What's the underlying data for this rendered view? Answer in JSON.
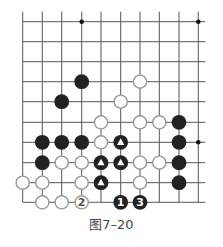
{
  "figure": {
    "caption": "图7–20",
    "board": {
      "columns": 10,
      "rows": 10,
      "col_x": [
        22.7,
        42.3,
        61.7,
        81.7,
        101,
        120.7,
        140,
        159.3,
        179,
        198.3
      ],
      "row_y": [
        21.7,
        41.7,
        61.7,
        81.7,
        101.7,
        122.3,
        142.3,
        162.7,
        182.7,
        202.3
      ],
      "edges": {
        "left": true,
        "bottom": true,
        "top": false,
        "right": false
      },
      "star_points": [
        [
          3,
          0
        ],
        [
          9,
          0
        ],
        [
          9,
          6
        ]
      ],
      "colors": {
        "line": "#555555",
        "black_stone": "#222222",
        "white_stroke": "#999999",
        "white_fill": "#ffffff",
        "marker": "#ffffff"
      },
      "stones": [
        {
          "color": "black",
          "col": 3,
          "row": 3
        },
        {
          "color": "white",
          "col": 6,
          "row": 3
        },
        {
          "color": "black",
          "col": 2,
          "row": 4
        },
        {
          "color": "white",
          "col": 5,
          "row": 4
        },
        {
          "color": "white",
          "col": 4,
          "row": 5
        },
        {
          "color": "white",
          "col": 6,
          "row": 5
        },
        {
          "color": "white",
          "col": 7,
          "row": 5
        },
        {
          "color": "black",
          "col": 8,
          "row": 5
        },
        {
          "color": "black",
          "col": 1,
          "row": 6
        },
        {
          "color": "black",
          "col": 2,
          "row": 6
        },
        {
          "color": "black",
          "col": 3,
          "row": 6
        },
        {
          "color": "white",
          "col": 4,
          "row": 6
        },
        {
          "color": "black",
          "col": 5,
          "row": 6,
          "mark": "triangle"
        },
        {
          "color": "black",
          "col": 8,
          "row": 6
        },
        {
          "color": "black",
          "col": 1,
          "row": 7
        },
        {
          "color": "white",
          "col": 2,
          "row": 7
        },
        {
          "color": "white",
          "col": 3,
          "row": 7
        },
        {
          "color": "black",
          "col": 4,
          "row": 7,
          "mark": "triangle"
        },
        {
          "color": "black",
          "col": 5,
          "row": 7,
          "mark": "triangle"
        },
        {
          "color": "white",
          "col": 6,
          "row": 7
        },
        {
          "color": "white",
          "col": 7,
          "row": 7
        },
        {
          "color": "black",
          "col": 8,
          "row": 7
        },
        {
          "color": "white",
          "col": 0,
          "row": 8
        },
        {
          "color": "white",
          "col": 1,
          "row": 8
        },
        {
          "color": "white",
          "col": 3,
          "row": 8
        },
        {
          "color": "black",
          "col": 4,
          "row": 8,
          "mark": "triangle"
        },
        {
          "color": "white",
          "col": 6,
          "row": 8
        },
        {
          "color": "black",
          "col": 8,
          "row": 8
        },
        {
          "color": "white",
          "col": 1,
          "row": 9
        },
        {
          "color": "white",
          "col": 2,
          "row": 9
        },
        {
          "color": "white",
          "col": 3,
          "row": 9,
          "label": "2"
        },
        {
          "color": "black",
          "col": 5,
          "row": 9,
          "label": "1"
        },
        {
          "color": "black",
          "col": 6,
          "row": 9,
          "label": "3"
        }
      ]
    }
  }
}
